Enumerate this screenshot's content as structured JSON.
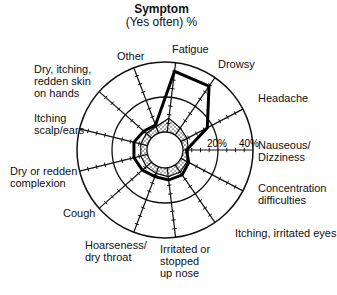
{
  "chart_data": {
    "type": "radar",
    "title": "Symptom",
    "subtitle": "(Yes often) %",
    "axis_ticks": [
      "20%",
      "40%"
    ],
    "rmax": 40,
    "grid": true,
    "categories": [
      "Nauseous/\nDizziness",
      "Headache",
      "Drowsy",
      "Fatigue",
      "Other",
      "Dry, itching,\nredden skin\non hands",
      "Itching\nscalp/ears",
      "Dry or redden\ncomplexion",
      "Cough",
      "Hoarseness/\ndry throat",
      "Irritated or\nstopped\nup nose",
      "Itching, irritated eyes",
      "Concentration\ndifficulties"
    ],
    "series": [
      {
        "name": "Exposed (thick line)",
        "style": "thick",
        "values": [
          2,
          17,
          34,
          35,
          5,
          6,
          8,
          8,
          7,
          6,
          7,
          7,
          5
        ]
      },
      {
        "name": "Reference (dotted fill)",
        "style": "dotted",
        "values": [
          3,
          4,
          5,
          8,
          4,
          4,
          4,
          4,
          4,
          4,
          5,
          5,
          4
        ]
      }
    ]
  },
  "labels": {
    "title": "Symptom",
    "subtitle": "(Yes often) %",
    "tick20": "20%",
    "tick40": "40%"
  }
}
